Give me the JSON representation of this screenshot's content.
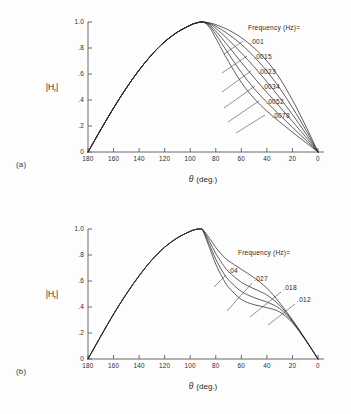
{
  "figure": {
    "background": "#fdfdfd",
    "ink": "#2b2b2b",
    "axis_color": "#6b6b6b"
  },
  "panels": [
    {
      "tag": "(a)",
      "legend_header": "Frequency (Hz)=",
      "legend_items": [
        ".001",
        ".0015",
        ".0023",
        ".0034",
        ".0052",
        ".0078"
      ]
    },
    {
      "tag": "(b)",
      "legend_header": "Frequency (Hz)=",
      "legend_items": [
        ".04",
        ".027",
        ".018",
        ".012"
      ]
    }
  ],
  "axes": {
    "x_title_symbol": "θ",
    "x_title_unit": "(deg.)",
    "y_title_main": "|H",
    "y_title_sub": "r",
    "y_title_tail": "|",
    "x_ticks": [
      "180",
      "160",
      "140",
      "120",
      "100",
      "80",
      "60",
      "40",
      "20",
      "0"
    ],
    "y_ticks": [
      "1.0",
      ".8",
      ".6",
      ".4",
      ".2",
      "0"
    ]
  },
  "chart_data": [
    {
      "type": "line",
      "title": "(a)",
      "xlabel": "θ (deg.)",
      "ylabel": "|Hr|",
      "xlim": [
        180,
        0
      ],
      "ylim": [
        0,
        1.0
      ],
      "x_reversed": true,
      "grid": false,
      "legend_position": "inside-upper-right",
      "legend_title": "Frequency (Hz)=",
      "x": [
        180,
        170,
        160,
        150,
        140,
        130,
        120,
        110,
        100,
        95,
        90,
        85,
        80,
        70,
        60,
        50,
        40,
        30,
        20,
        10,
        0
      ],
      "series": [
        {
          "name": ".001",
          "values": [
            0.0,
            0.172,
            0.338,
            0.492,
            0.63,
            0.75,
            0.848,
            0.922,
            0.975,
            0.993,
            1.0,
            0.993,
            0.98,
            0.938,
            0.88,
            0.8,
            0.7,
            0.568,
            0.4,
            0.208,
            0.0
          ]
        },
        {
          "name": ".0015",
          "values": [
            0.0,
            0.172,
            0.338,
            0.492,
            0.63,
            0.75,
            0.848,
            0.922,
            0.975,
            0.993,
            1.0,
            0.99,
            0.968,
            0.905,
            0.828,
            0.733,
            0.622,
            0.492,
            0.342,
            0.178,
            0.0
          ]
        },
        {
          "name": ".0023",
          "values": [
            0.0,
            0.172,
            0.338,
            0.492,
            0.63,
            0.75,
            0.848,
            0.922,
            0.975,
            0.993,
            1.0,
            0.985,
            0.952,
            0.862,
            0.762,
            0.655,
            0.54,
            0.418,
            0.288,
            0.148,
            0.0
          ]
        },
        {
          "name": ".0034",
          "values": [
            0.0,
            0.172,
            0.338,
            0.492,
            0.63,
            0.75,
            0.848,
            0.922,
            0.975,
            0.993,
            1.0,
            0.978,
            0.93,
            0.812,
            0.69,
            0.572,
            0.458,
            0.348,
            0.236,
            0.12,
            0.0
          ]
        },
        {
          "name": ".0052",
          "values": [
            0.0,
            0.172,
            0.338,
            0.492,
            0.63,
            0.75,
            0.848,
            0.922,
            0.975,
            0.993,
            1.0,
            0.97,
            0.905,
            0.755,
            0.612,
            0.488,
            0.382,
            0.285,
            0.19,
            0.096,
            0.0
          ]
        },
        {
          "name": ".0078",
          "values": [
            0.0,
            0.172,
            0.338,
            0.492,
            0.63,
            0.75,
            0.848,
            0.922,
            0.975,
            0.993,
            1.0,
            0.96,
            0.875,
            0.695,
            0.535,
            0.412,
            0.315,
            0.232,
            0.152,
            0.076,
            0.0
          ]
        }
      ]
    },
    {
      "type": "line",
      "title": "(b)",
      "xlabel": "θ (deg.)",
      "ylabel": "|Hr|",
      "xlim": [
        180,
        0
      ],
      "ylim": [
        0,
        1.0
      ],
      "x_reversed": true,
      "grid": false,
      "legend_position": "inside-upper-right",
      "legend_title": "Frequency (Hz)=",
      "x": [
        180,
        170,
        160,
        150,
        140,
        130,
        120,
        110,
        100,
        95,
        92,
        90,
        85,
        80,
        75,
        70,
        60,
        50,
        40,
        30,
        20,
        10,
        0
      ],
      "series": [
        {
          "name": ".04",
          "values": [
            0.0,
            0.175,
            0.345,
            0.5,
            0.64,
            0.762,
            0.86,
            0.932,
            0.982,
            0.998,
            1.0,
            0.995,
            0.93,
            0.858,
            0.8,
            0.755,
            0.69,
            0.625,
            0.545,
            0.432,
            0.3,
            0.155,
            0.0
          ]
        },
        {
          "name": ".027",
          "values": [
            0.0,
            0.175,
            0.345,
            0.5,
            0.64,
            0.762,
            0.86,
            0.932,
            0.982,
            0.998,
            1.0,
            0.992,
            0.905,
            0.812,
            0.735,
            0.672,
            0.59,
            0.54,
            0.492,
            0.412,
            0.295,
            0.152,
            0.0
          ]
        },
        {
          "name": ".018",
          "values": [
            0.0,
            0.175,
            0.345,
            0.5,
            0.64,
            0.762,
            0.86,
            0.932,
            0.982,
            0.998,
            1.0,
            0.988,
            0.88,
            0.768,
            0.678,
            0.608,
            0.52,
            0.472,
            0.438,
            0.388,
            0.288,
            0.15,
            0.0
          ]
        },
        {
          "name": ".012",
          "values": [
            0.0,
            0.175,
            0.345,
            0.5,
            0.64,
            0.762,
            0.86,
            0.932,
            0.982,
            0.998,
            1.0,
            0.984,
            0.858,
            0.73,
            0.63,
            0.552,
            0.458,
            0.418,
            0.395,
            0.362,
            0.278,
            0.148,
            0.0
          ]
        }
      ]
    }
  ],
  "legend_layout": {
    "panel_a": {
      "header_x": 248,
      "header_y": 30,
      "items": [
        {
          "label": ".001",
          "tx": 250,
          "ty": 44,
          "lx1": 243,
          "ly1": 41,
          "lx2": 224,
          "ly2": 54
        },
        {
          "label": ".0015",
          "tx": 254,
          "ty": 59,
          "lx1": 247,
          "ly1": 56,
          "lx2": 222,
          "ly2": 73
        },
        {
          "label": ".0023",
          "tx": 258,
          "ty": 74,
          "lx1": 251,
          "ly1": 71,
          "lx2": 222,
          "ly2": 92
        },
        {
          "label": ".0034",
          "tx": 262,
          "ty": 89,
          "lx1": 255,
          "ly1": 86,
          "lx2": 224,
          "ly2": 108
        },
        {
          "label": ".0052",
          "tx": 266,
          "ty": 104,
          "lx1": 259,
          "ly1": 101,
          "lx2": 228,
          "ly2": 122
        },
        {
          "label": ".0078",
          "tx": 272,
          "ty": 118,
          "lx1": 265,
          "ly1": 115,
          "lx2": 236,
          "ly2": 133
        }
      ]
    },
    "panel_b": {
      "header_x": 238,
      "header_y": 48,
      "items": [
        {
          "label": ".04",
          "tx": 228,
          "ty": 66,
          "lx1": 226,
          "ly1": 68,
          "lx2": 214,
          "ly2": 80
        },
        {
          "label": ".027",
          "tx": 254,
          "ty": 74,
          "lx1": 252,
          "ly1": 76,
          "lx2": 227,
          "ly2": 104
        },
        {
          "label": ".018",
          "tx": 283,
          "ty": 83,
          "lx1": 281,
          "ly1": 85,
          "lx2": 250,
          "ly2": 110
        },
        {
          "label": ".012",
          "tx": 297,
          "ty": 95,
          "lx1": 295,
          "ly1": 97,
          "lx2": 268,
          "ly2": 118
        }
      ]
    }
  }
}
